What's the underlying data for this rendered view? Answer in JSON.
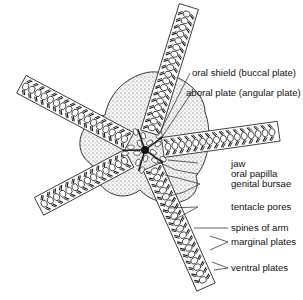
{
  "figure": {
    "labels": [
      {
        "id": "oral-shield",
        "text": "oral shield (buccal plate)"
      },
      {
        "id": "aboral-plate",
        "text": "aboral plate (angular plate)"
      },
      {
        "id": "jaw",
        "text": "jaw"
      },
      {
        "id": "oral-papilla",
        "text": "oral papilla"
      },
      {
        "id": "genital-bursae",
        "text": "genital bursae"
      },
      {
        "id": "tentacle-pores",
        "text": "tentacle pores"
      },
      {
        "id": "spines-of-arm",
        "text": "spines of arm"
      },
      {
        "id": "marginal-plates",
        "text": "marginal plates"
      },
      {
        "id": "ventral-plates",
        "text": "ventral plates"
      }
    ],
    "colors": {
      "ink": "#111111",
      "disc": "#f4f4f4",
      "background": "#ffffff"
    }
  }
}
